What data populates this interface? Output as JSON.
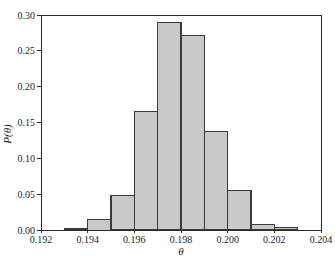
{
  "window": {
    "width": 335,
    "height": 259,
    "background": "#ffffff"
  },
  "chart_data": {
    "type": "bar",
    "subtype": "histogram",
    "title": "",
    "xlabel": "θ",
    "ylabel": "P(θ)",
    "xlim": [
      0.192,
      0.204
    ],
    "ylim": [
      0,
      0.3
    ],
    "grid": false,
    "legend": null,
    "x_tick_values": [
      0.192,
      0.194,
      0.196,
      0.198,
      0.2,
      0.202,
      0.204
    ],
    "x_tick_labels": [
      "0.192",
      "0.194",
      "0.196",
      "0.198",
      "0.200",
      "0.202",
      "0.204"
    ],
    "y_tick_values": [
      0.0,
      0.05,
      0.1,
      0.15,
      0.2,
      0.25,
      0.3
    ],
    "y_tick_labels": [
      "0.00",
      "0.05",
      "0.10",
      "0.15",
      "0.20",
      "0.25",
      "0.30"
    ],
    "bin_width": 0.001,
    "bins": [
      {
        "left": 0.193,
        "right": 0.194,
        "p": 0.002
      },
      {
        "left": 0.194,
        "right": 0.195,
        "p": 0.015
      },
      {
        "left": 0.195,
        "right": 0.196,
        "p": 0.048
      },
      {
        "left": 0.196,
        "right": 0.197,
        "p": 0.165
      },
      {
        "left": 0.197,
        "right": 0.198,
        "p": 0.29
      },
      {
        "left": 0.198,
        "right": 0.199,
        "p": 0.272
      },
      {
        "left": 0.199,
        "right": 0.2,
        "p": 0.138
      },
      {
        "left": 0.2,
        "right": 0.201,
        "p": 0.055
      },
      {
        "left": 0.201,
        "right": 0.202,
        "p": 0.008
      },
      {
        "left": 0.202,
        "right": 0.203,
        "p": 0.003
      }
    ],
    "colors": {
      "bar_fill": "#c9c9c9",
      "bar_stroke": "#3a3a3a",
      "axis_stroke": "#2b2b2b",
      "text": "#1c1c1c"
    }
  }
}
